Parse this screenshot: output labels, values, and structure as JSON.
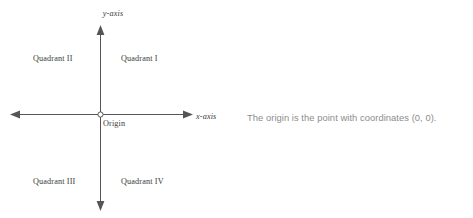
{
  "canvas": {
    "width": 473,
    "height": 218,
    "background": "#ffffff"
  },
  "diagram": {
    "kind": "cartesian-coordinate-plane",
    "line_color": "#555555",
    "text_color": "#3a3a3a",
    "origin_marker": "open-circle",
    "axes": {
      "x_axis": {
        "label": "x-axis",
        "style": "italic-serif",
        "from_x": 10,
        "to_x": 193,
        "y": 114,
        "arrowheads": [
          "left",
          "right"
        ]
      },
      "y_axis": {
        "label": "y-axis",
        "style": "italic-serif",
        "from_y": 25,
        "to_y": 211,
        "x": 100,
        "arrowheads": [
          "up",
          "down"
        ]
      }
    },
    "origin": {
      "label": "Origin",
      "x": 100,
      "y": 114
    },
    "quadrants": [
      {
        "label": "Quadrant I",
        "position": "upper-right"
      },
      {
        "label": "Quadrant II",
        "position": "upper-left"
      },
      {
        "label": "Quadrant III",
        "position": "lower-left"
      },
      {
        "label": "Quadrant IV",
        "position": "lower-right"
      }
    ]
  },
  "caption": {
    "text": "The origin is the point with coordinates (0, 0).",
    "color": "#8c8c8c"
  }
}
